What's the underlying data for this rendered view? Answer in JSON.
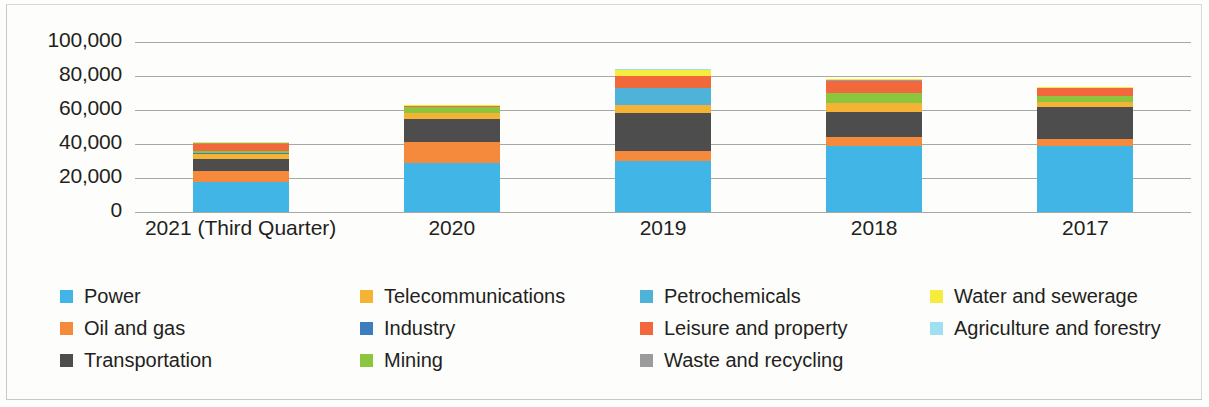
{
  "chart_data": {
    "type": "bar",
    "stacked": true,
    "title": "",
    "xlabel": "",
    "ylabel": "",
    "ylim": [
      0,
      100000
    ],
    "yticks": [
      0,
      20000,
      40000,
      60000,
      80000,
      100000
    ],
    "ytick_labels": [
      "0",
      "20,000",
      "40,000",
      "60,000",
      "80,000",
      "100,000"
    ],
    "grid": true,
    "legend_position": "bottom",
    "categories": [
      "2021 (Third Quarter)",
      "2020",
      "2019",
      "2018",
      "2017"
    ],
    "series": [
      {
        "name": "Power",
        "color": "#41b6e6",
        "values": [
          17500,
          29000,
          30000,
          39000,
          39000
        ]
      },
      {
        "name": "Oil and gas",
        "color": "#f58a3c",
        "values": [
          6500,
          12000,
          6000,
          5000,
          4000
        ]
      },
      {
        "name": "Transportation",
        "color": "#4d4d4d",
        "values": [
          7000,
          14000,
          22000,
          15000,
          19000
        ]
      },
      {
        "name": "Telecommunications",
        "color": "#f5b335",
        "values": [
          3000,
          3000,
          5000,
          5000,
          3000
        ]
      },
      {
        "name": "Industry",
        "color": "#3b7dbd",
        "values": [
          900,
          0,
          0,
          0,
          0
        ]
      },
      {
        "name": "Mining",
        "color": "#8cc63e",
        "values": [
          1200,
          4000,
          0,
          6000,
          3000
        ]
      },
      {
        "name": "Petrochemicals",
        "color": "#4fb3d9",
        "values": [
          0,
          0,
          10000,
          0,
          0
        ]
      },
      {
        "name": "Leisure and property",
        "color": "#f2683c",
        "values": [
          4000,
          600,
          7000,
          7000,
          5000
        ]
      },
      {
        "name": "Waste and recycling",
        "color": "#9b9b9b",
        "values": [
          700,
          0,
          0,
          500,
          0
        ]
      },
      {
        "name": "Water and sewerage",
        "color": "#f5ec3d",
        "values": [
          600,
          400,
          3500,
          600,
          400
        ]
      },
      {
        "name": "Agriculture and forestry",
        "color": "#9fdff2",
        "values": [
          0,
          0,
          500,
          0,
          0
        ]
      }
    ],
    "totals": [
      41400,
      63000,
      84000,
      78100,
      73400
    ]
  },
  "legend": {
    "items": [
      {
        "label": "Power",
        "color": "#41b6e6",
        "icon": "legend-swatch-power"
      },
      {
        "label": "Oil and gas",
        "color": "#f58a3c",
        "icon": "legend-swatch-oil-and-gas"
      },
      {
        "label": "Transportation",
        "color": "#4d4d4d",
        "icon": "legend-swatch-transportation"
      },
      {
        "label": "Telecommunications",
        "color": "#f5b335",
        "icon": "legend-swatch-telecommunications"
      },
      {
        "label": "Industry",
        "color": "#3b7dbd",
        "icon": "legend-swatch-industry"
      },
      {
        "label": "Mining",
        "color": "#8cc63e",
        "icon": "legend-swatch-mining"
      },
      {
        "label": "Petrochemicals",
        "color": "#4fb3d9",
        "icon": "legend-swatch-petrochemicals"
      },
      {
        "label": "Leisure and property",
        "color": "#f2683c",
        "icon": "legend-swatch-leisure-and-property"
      },
      {
        "label": "Waste and recycling",
        "color": "#9b9b9b",
        "icon": "legend-swatch-waste-and-recycling"
      },
      {
        "label": "Water and sewerage",
        "color": "#f5ec3d",
        "icon": "legend-swatch-water-and-sewerage"
      },
      {
        "label": "Agriculture and forestry",
        "color": "#9fdff2",
        "icon": "legend-swatch-agriculture-and-forestry"
      }
    ]
  }
}
